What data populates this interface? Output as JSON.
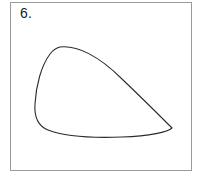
{
  "figure": {
    "label": "6.",
    "background_color": "#ffffff",
    "frame": {
      "border_color": "#9a9a9a",
      "border_width": 1,
      "x": 10,
      "y": 2,
      "width": 182,
      "height": 169
    },
    "shape": {
      "name": "closed-convex-curve",
      "description": "Closed smooth convex outline resembling a teardrop or wing: rounded left lobe, rounded apex at upper left, long gently concave diagonal descending to a pointed tip at the right, nearly flat bottom edge returning to the left lobe.",
      "stroke_color": "#2b2b2b",
      "stroke_width": 1.1,
      "fill": "none",
      "extreme_points": {
        "top_apex": [
          60,
          47
        ],
        "leftmost": [
          35,
          95
        ],
        "rightmost_tip": [
          172,
          128
        ],
        "bottom_lowest": [
          104,
          136
        ]
      },
      "path": "M 60 47 C 77 45 99 56 122 79 C 143 99 163 119 172 128 C 168 132 150 136 122 137 C 96 138 66 137 48 130 C 38 126 34 118 35 104 C 36 86 41 66 50 54 C 53 50 56 48 60 47 Z"
    }
  }
}
